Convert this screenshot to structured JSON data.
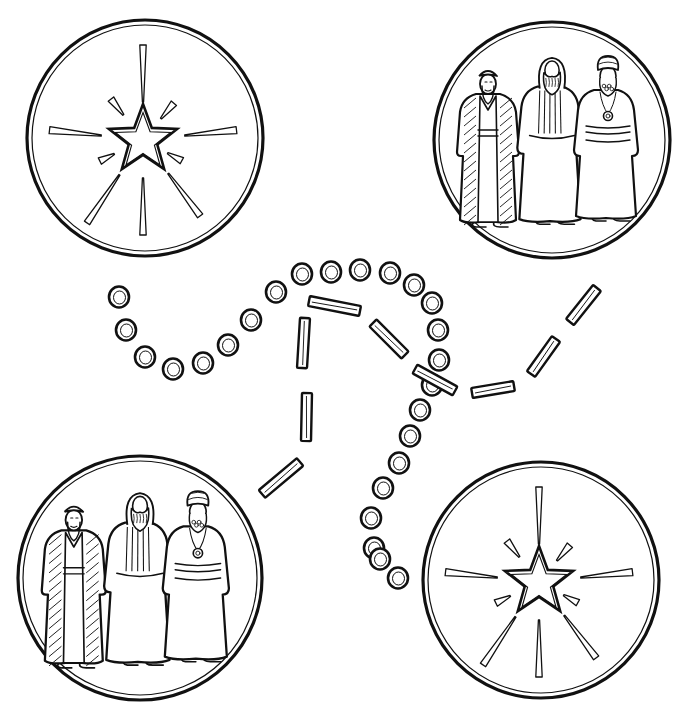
{
  "page": {
    "title": "Wise men following the star — path coloring page",
    "ink_color": "#111111",
    "background": "#ffffff"
  },
  "medallions": [
    {
      "id": "star-top-left",
      "content": "star-burst",
      "cx": 145,
      "cy": 138,
      "r": 118
    },
    {
      "id": "magi-top-right",
      "content": "three-wise-men",
      "cx": 552,
      "cy": 140,
      "r": 118
    },
    {
      "id": "magi-bottom-left",
      "content": "three-wise-men",
      "cx": 140,
      "cy": 578,
      "r": 122
    },
    {
      "id": "star-bottom-right",
      "content": "star-burst",
      "cx": 541,
      "cy": 580,
      "r": 118
    }
  ],
  "figures": [
    {
      "id": "wise-man-1",
      "description": "striped open robe, cap, long beard"
    },
    {
      "id": "wise-man-2",
      "description": "hooded, striped tunic, full beard"
    },
    {
      "id": "wise-man-3",
      "description": "turban, medallion necklace, sash"
    }
  ],
  "paths": {
    "dotted": {
      "style": "circles",
      "points": [
        [
          119,
          297
        ],
        [
          126,
          330
        ],
        [
          145,
          357
        ],
        [
          173,
          369
        ],
        [
          203,
          363
        ],
        [
          228,
          345
        ],
        [
          251,
          320
        ],
        [
          276,
          292
        ],
        [
          302,
          274
        ],
        [
          331,
          272
        ],
        [
          360,
          270
        ],
        [
          390,
          273
        ],
        [
          414,
          285
        ],
        [
          432,
          303
        ],
        [
          438,
          330
        ],
        [
          439,
          360
        ],
        [
          432,
          385
        ],
        [
          420,
          410
        ],
        [
          410,
          436
        ],
        [
          399,
          463
        ],
        [
          383,
          488
        ],
        [
          371,
          518
        ],
        [
          374,
          548
        ],
        [
          380,
          559
        ],
        [
          398,
          578
        ]
      ]
    },
    "dashed": {
      "style": "bars",
      "segments": [
        {
          "x1": 309,
          "y1": 301,
          "x2": 360,
          "y2": 311
        },
        {
          "x1": 305,
          "y1": 318,
          "x2": 302,
          "y2": 368
        },
        {
          "x1": 373,
          "y1": 323,
          "x2": 405,
          "y2": 355
        },
        {
          "x1": 415,
          "y1": 369,
          "x2": 455,
          "y2": 391
        },
        {
          "x1": 472,
          "y1": 393,
          "x2": 514,
          "y2": 386
        },
        {
          "x1": 531,
          "y1": 374,
          "x2": 556,
          "y2": 339
        },
        {
          "x1": 570,
          "y1": 322,
          "x2": 597,
          "y2": 288
        },
        {
          "x1": 307,
          "y1": 393,
          "x2": 306,
          "y2": 441
        },
        {
          "x1": 262,
          "y1": 494,
          "x2": 300,
          "y2": 462
        }
      ]
    }
  }
}
